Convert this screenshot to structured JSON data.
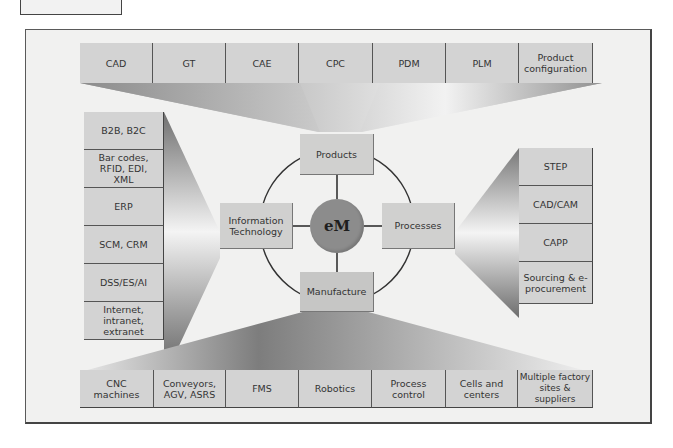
{
  "diagram": {
    "hub": {
      "label": "eM",
      "color": "#8c8c8c"
    },
    "pillars": {
      "top": "Products",
      "left": "Information Technology",
      "right": "Processes",
      "bottom": "Manufacture"
    },
    "products_technologies": [
      "CAD",
      "GT",
      "CAE",
      "CPC",
      "PDM",
      "PLM",
      "Product configuration"
    ],
    "it_technologies": [
      "B2B, B2C",
      "Bar codes, RFID, EDI, XML",
      "ERP",
      "SCM, CRM",
      "DSS/ES/AI",
      "Internet, intranet, extranet"
    ],
    "process_technologies": [
      "STEP",
      "CAD/CAM",
      "CAPP",
      "Sourcing & e-procurement"
    ],
    "manufacture_technologies": [
      "CNC machines",
      "Conveyors, AGV, ASRS",
      "FMS",
      "Robotics",
      "Process control",
      "Cells and centers",
      "Multiple factory sites & suppliers"
    ],
    "colors": {
      "frame_bg": "#f1f1f0",
      "cell_bg": "#d3d3d3",
      "funnel_dark": "#7a7a7a",
      "funnel_light": "#f4f4f4"
    }
  }
}
